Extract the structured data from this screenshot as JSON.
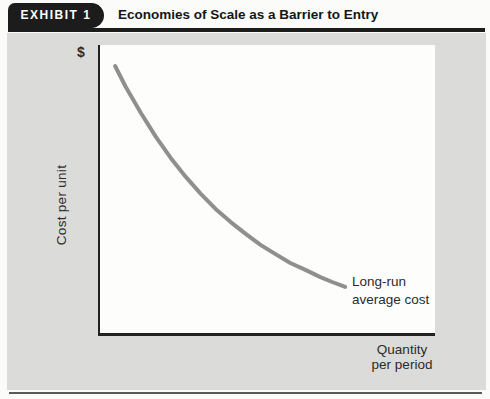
{
  "header": {
    "badge": "EXHIBIT 1",
    "title": "Economies of Scale as a Barrier to Entry"
  },
  "figure": {
    "dollar_sign": "$",
    "y_axis_label": "Cost per unit",
    "x_axis_label": "Quantity\nper period",
    "curve_label": "Long-run\naverage cost"
  },
  "colors": {
    "badge_bg": "#1c1c1c",
    "rule": "#1c1c1c",
    "panel_bg": "#dbdbd9",
    "plot_bg": "#fdfdfc",
    "axis": "#222222",
    "curve": "#8f8f8f",
    "text": "#2b2b2b",
    "bottom_rule": "#5a5a5a",
    "page_bg": "#fbfbfa"
  },
  "chart_data": {
    "type": "line",
    "title": "Economies of Scale as a Barrier to Entry",
    "xlabel": "Quantity per period",
    "ylabel": "Cost per unit ($)",
    "axes_numeric": false,
    "grid": false,
    "legend_position": "annotation-right-of-curve-end",
    "series": [
      {
        "name": "Long-run average cost",
        "points": [
          [
            0.045,
            0.927
          ],
          [
            0.077,
            0.854
          ],
          [
            0.122,
            0.764
          ],
          [
            0.167,
            0.681
          ],
          [
            0.211,
            0.608
          ],
          [
            0.256,
            0.542
          ],
          [
            0.301,
            0.483
          ],
          [
            0.345,
            0.431
          ],
          [
            0.39,
            0.385
          ],
          [
            0.435,
            0.344
          ],
          [
            0.479,
            0.306
          ],
          [
            0.524,
            0.274
          ],
          [
            0.568,
            0.243
          ],
          [
            0.613,
            0.219
          ],
          [
            0.658,
            0.194
          ],
          [
            0.693,
            0.177
          ],
          [
            0.732,
            0.16
          ]
        ]
      }
    ]
  }
}
